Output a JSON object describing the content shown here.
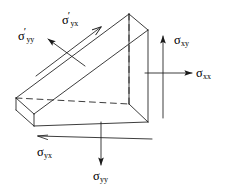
{
  "figure": {
    "name": "stress-wedge-element-diagram",
    "background_color": "#ffffff",
    "line_color": "#1a1a1a",
    "labels": {
      "sigma_prime_yy": {
        "symbol": "σ",
        "prime": "′",
        "subscript": "yy"
      },
      "sigma_prime_yx": {
        "symbol": "σ",
        "prime": "′",
        "subscript": "yx"
      },
      "sigma_xy": {
        "symbol": "σ",
        "prime": "",
        "subscript": "xy"
      },
      "sigma_xx": {
        "symbol": "σ",
        "prime": "",
        "subscript": "xx"
      },
      "sigma_yx": {
        "symbol": "σ",
        "prime": "",
        "subscript": "yx"
      },
      "sigma_yy": {
        "symbol": "σ",
        "prime": "",
        "subscript": "yy"
      }
    }
  }
}
